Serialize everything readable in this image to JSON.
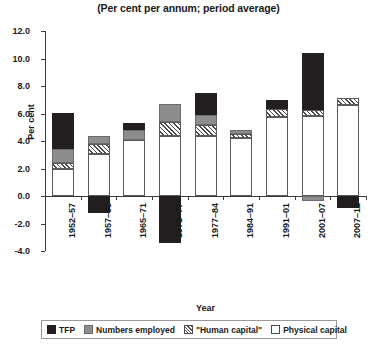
{
  "chart_data": {
    "type": "bar",
    "title": "(Per cent per annum; period average)",
    "xlabel": "Year",
    "ylabel": "Per cent",
    "ylim": [
      -4.0,
      12.0
    ],
    "ytick_step": 2.0,
    "ytick_labels": [
      "12.0",
      "10.0",
      "8.0",
      "6.0",
      "4.0",
      "2.0",
      "0.0",
      "-2.0",
      "-4.0"
    ],
    "ytick_values": [
      12.0,
      10.0,
      8.0,
      6.0,
      4.0,
      2.0,
      0.0,
      -2.0,
      -4.0
    ],
    "grid": false,
    "stacked": true,
    "legend_position": "bottom",
    "categories": [
      "1952–57",
      "1957–65",
      "1965–71",
      "1971–77",
      "1977–84",
      "1984–91",
      "1991–01",
      "2001–07",
      "2007–12"
    ],
    "series": [
      {
        "name": "Physical capital",
        "color": "#ffffff",
        "pattern": "solid",
        "values": [
          2.0,
          3.05,
          4.1,
          4.35,
          4.35,
          4.2,
          5.75,
          5.8,
          6.6
        ]
      },
      {
        "name": "\"Human capital\"",
        "color": "#ffffff",
        "pattern": "hatched",
        "values": [
          0.4,
          0.7,
          0.0,
          1.05,
          0.85,
          0.3,
          0.6,
          0.45,
          0.5
        ]
      },
      {
        "name": "Numbers employed",
        "color": "#8d8d8d",
        "pattern": "solid",
        "values": [
          1.0,
          0.6,
          0.7,
          1.3,
          0.7,
          0.3,
          0.0,
          -0.35,
          0.0
        ]
      },
      {
        "name": "TFP",
        "color": "#231f20",
        "pattern": "solid",
        "values": [
          2.65,
          -1.2,
          0.5,
          -3.45,
          1.6,
          0.0,
          0.6,
          4.15,
          -0.9
        ]
      }
    ],
    "totals_positive": [
      6.05,
      4.35,
      5.3,
      6.7,
      7.5,
      4.8,
      6.95,
      10.4,
      7.1
    ],
    "totals_negative": [
      0.0,
      -1.2,
      0.0,
      -3.45,
      0.0,
      0.0,
      0.0,
      -0.35,
      -0.9
    ]
  },
  "legend": {
    "items": [
      {
        "label": "TFP",
        "icon": "legend-swatch-tfp"
      },
      {
        "label": "Numbers employed",
        "icon": "legend-swatch-numbers-employed"
      },
      {
        "label": "\"Human capital\"",
        "icon": "legend-swatch-human-capital"
      },
      {
        "label": "Physical capital",
        "icon": "legend-swatch-physical-capital"
      }
    ]
  }
}
